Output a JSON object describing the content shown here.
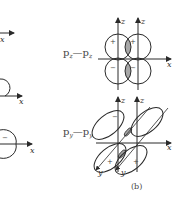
{
  "figure": {
    "caption": "(b)",
    "colors": {
      "line": "#2a2a2a",
      "shade": "#a8a8a8",
      "text": "#444444"
    }
  },
  "left_partial": {
    "axis_labels": [
      "x",
      "x",
      "x"
    ],
    "signs": [
      "−"
    ]
  },
  "top_diagram": {
    "label": "p₂—p₂",
    "label_main": "p",
    "label_sub": "z",
    "dash": "—",
    "axis_labels": {
      "z1": "z",
      "z2": "z",
      "x": "x"
    },
    "signs": {
      "top_left": "+",
      "top_right": "+",
      "bottom_left": "−",
      "bottom_right": "−"
    }
  },
  "bottom_diagram": {
    "label_main": "p",
    "label_sub": "y",
    "dash": "—",
    "axis_labels": {
      "z1": "z",
      "z2": "z",
      "x": "x",
      "y1": "y",
      "y2": "y"
    },
    "signs": {
      "top_left": "−",
      "bottom_left": "+",
      "bottom_right": "+"
    }
  }
}
